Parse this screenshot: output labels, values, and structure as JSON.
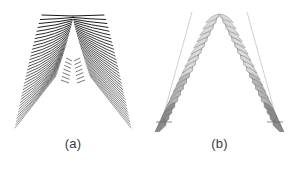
{
  "figure": {
    "background_color": "#ffffff",
    "panel_count": 2
  },
  "panels": [
    {
      "id": "a",
      "caption": "(a)",
      "style_name": "dense-striped-wings",
      "description": "V-shaped pair of wings drawn as many fine dark stripes",
      "stroke_color": "#1a1a1a",
      "blade_count": 34
    },
    {
      "id": "b",
      "caption": "(b)",
      "style_name": "discrete-rib-blades",
      "description": "V-shaped pair of arms drawn as discrete gray rib blades on thin spines with base ticks",
      "stroke_color": "#6e6e6e",
      "fill_light": "#d7d7d7",
      "fill_dark": "#8c8c8c",
      "blade_count": 19
    }
  ],
  "chart_data": {
    "type": "scatter",
    "title": "",
    "xlabel": "",
    "ylabel": "",
    "grid": false,
    "legend": "none",
    "panels": [
      {
        "name": "(a)",
        "kind": "dense-striped-wings",
        "apex": [
          73,
          16
        ],
        "left_arm": {
          "top": [
            41,
            15
          ],
          "tip": [
            15,
            128
          ],
          "blades": 34
        },
        "right_arm": {
          "top": [
            105,
            15
          ],
          "tip": [
            131,
            128
          ],
          "blades": 34
        },
        "color": "#1a1a1a"
      },
      {
        "name": "(b)",
        "kind": "discrete-rib-blades",
        "apex": [
          73,
          14
        ],
        "left_arm": {
          "top": [
            45,
            12
          ],
          "foot": [
            14,
            122
          ],
          "blades": 19,
          "has_base_tick": true
        },
        "right_arm": {
          "top": [
            101,
            12
          ],
          "foot": [
            132,
            122
          ],
          "blades": 19,
          "has_base_tick": true
        },
        "color": "#6e6e6e"
      }
    ]
  }
}
